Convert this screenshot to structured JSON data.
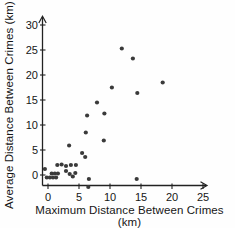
{
  "figure": {
    "x_axis_title": "Maximum Distance Between Crimes (km)",
    "y_axis_title": "Average Distance Between Crimes (km)"
  },
  "chart_data": {
    "type": "scatter",
    "title": "",
    "xlabel": "Maximum Distance Between Crimes (km)",
    "ylabel": "Average Distance Between Crimes (km)",
    "x_ticks": [
      0,
      5,
      10,
      15,
      20,
      25
    ],
    "y_ticks": [
      0,
      5,
      10,
      15,
      20,
      25,
      30
    ],
    "xlim": [
      -1,
      26.5
    ],
    "ylim": [
      -2.5,
      31.5
    ],
    "grid": false,
    "legend": null,
    "axis_color": "#222222",
    "point_color": "#3a3a3a",
    "points": [
      [
        -0.5,
        1.2
      ],
      [
        -0.2,
        -0.5
      ],
      [
        0.3,
        -0.5
      ],
      [
        0.8,
        -0.5
      ],
      [
        1.3,
        -0.5
      ],
      [
        0.6,
        0.3
      ],
      [
        1.1,
        0.3
      ],
      [
        1.6,
        0.3
      ],
      [
        1.5,
        2.0
      ],
      [
        2.2,
        2.1
      ],
      [
        2.9,
        1.8
      ],
      [
        3.7,
        2.0
      ],
      [
        4.5,
        2.0
      ],
      [
        2.9,
        0.8
      ],
      [
        3.5,
        0.2
      ],
      [
        4.0,
        -0.3
      ],
      [
        4.4,
        0.4
      ],
      [
        6.6,
        -0.8
      ],
      [
        6.5,
        -2.4
      ],
      [
        14.3,
        -0.8
      ],
      [
        3.4,
        5.9
      ],
      [
        5.5,
        4.4
      ],
      [
        6.0,
        3.6
      ],
      [
        6.1,
        8.5
      ],
      [
        6.3,
        11.9
      ],
      [
        7.9,
        14.5
      ],
      [
        9.0,
        6.9
      ],
      [
        9.1,
        12.3
      ],
      [
        10.3,
        17.5
      ],
      [
        11.9,
        25.3
      ],
      [
        13.7,
        23.3
      ],
      [
        14.4,
        16.4
      ],
      [
        18.5,
        18.5
      ]
    ]
  }
}
